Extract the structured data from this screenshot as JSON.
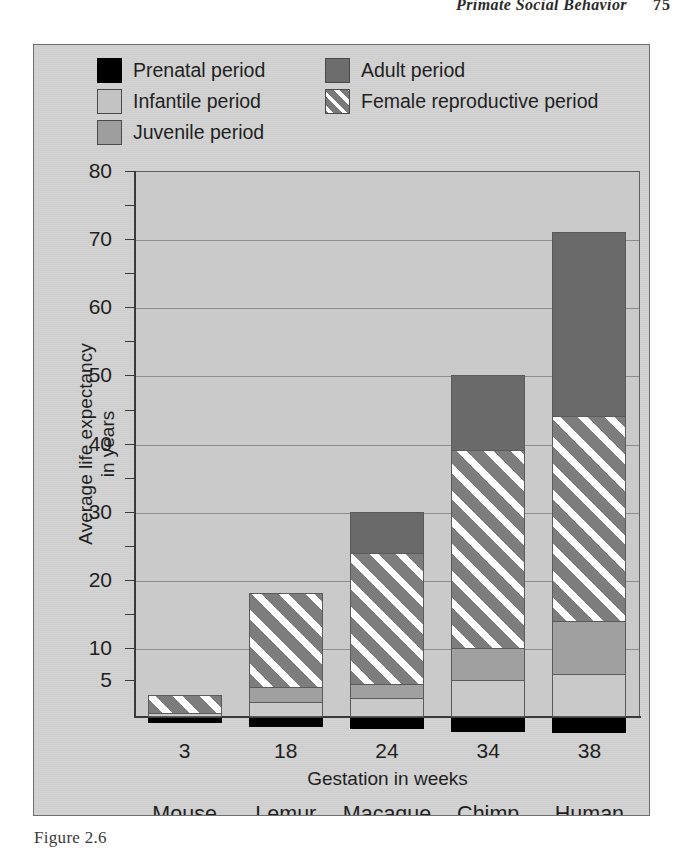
{
  "running_head": {
    "title": "Primate Social Behavior",
    "page": "75"
  },
  "caption": {
    "text": "Figure 2.6"
  },
  "legend": {
    "items": [
      {
        "label": "Prenatal period",
        "key": "prenatal",
        "swatch": "black-swatch-icon",
        "color": "#000000"
      },
      {
        "label": "Adult period",
        "key": "adult",
        "swatch": "dark-gray-swatch-icon",
        "color": "#6d6d6d"
      },
      {
        "label": "Infantile period",
        "key": "infantile",
        "swatch": "light-gray-swatch-icon",
        "color": "#c4c4c4"
      },
      {
        "label": "Female reproductive period",
        "key": "repro",
        "swatch": "hatched-swatch-icon",
        "color": "#7a7a7a"
      },
      {
        "label": "Juvenile period",
        "key": "juvenile",
        "swatch": "mid-gray-swatch-icon",
        "color": "#9e9e9e"
      }
    ]
  },
  "chart_data": {
    "type": "bar",
    "subtype": "stacked-bar",
    "title": "",
    "xlabel": "Gestation in weeks",
    "ylabel": "Average life expectancy in years",
    "categories": [
      "Mouse",
      "Lemur",
      "Macaque",
      "Chimp",
      "Human"
    ],
    "x_tick_labels": [
      "3",
      "18",
      "24",
      "34",
      "38"
    ],
    "gestation_weeks": [
      3,
      18,
      24,
      34,
      38
    ],
    "ylim": [
      0,
      80
    ],
    "y_tick_labels": [
      "80",
      "70",
      "60",
      "50",
      "40",
      "30",
      "20",
      "10",
      "5"
    ],
    "y_major_ticks": [
      80,
      70,
      60,
      50,
      40,
      30,
      20,
      10
    ],
    "y_minor_ticks": [
      75,
      65,
      55,
      45,
      35,
      25,
      15,
      5
    ],
    "grid": true,
    "legend_position": "top",
    "note": "Vertical scale is compressed below 10 years so the 5-year tick is visible.",
    "total_life_expectancy": [
      3,
      18,
      30,
      50,
      71
    ],
    "series": [
      {
        "name": "Infantile period",
        "key": "infantile",
        "values": [
          0.5,
          2,
          2.5,
          5,
          6
        ]
      },
      {
        "name": "Juvenile period",
        "key": "juvenile",
        "values": [
          0,
          4,
          4.5,
          10,
          14
        ]
      },
      {
        "name": "Female reproductive period",
        "key": "repro",
        "values": [
          3,
          18,
          24,
          39,
          44
        ]
      },
      {
        "name": "Adult period",
        "key": "adult",
        "values": [
          3,
          18,
          30,
          50,
          71
        ]
      }
    ],
    "stack_tops": {
      "infantile": [
        0.5,
        2,
        2.5,
        5,
        6
      ],
      "juvenile": [
        0.5,
        4,
        4.5,
        10,
        14
      ],
      "repro": [
        3,
        18,
        24,
        39,
        44
      ],
      "adult": [
        3,
        18,
        30,
        50,
        71
      ]
    }
  }
}
